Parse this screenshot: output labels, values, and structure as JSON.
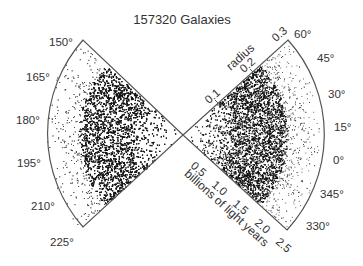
{
  "chart_data": {
    "type": "scatter",
    "subtype": "polar-wedge (galaxy redshift survey cone diagram)",
    "title": "157320 Galaxies",
    "point_count": 157320,
    "radial_axis": {
      "inner_label": "radius",
      "inner_ticks": [
        "0.1",
        "0.2",
        "0.3"
      ],
      "outer_label": "billions of light years",
      "outer_ticks": [
        "0.5",
        "1.0",
        "1.5",
        "2.0",
        "2.5"
      ],
      "range": [
        0,
        2.5
      ]
    },
    "angle_labels_right": [
      "60°",
      "45°",
      "30°",
      "15°",
      "0°",
      "345°",
      "330°"
    ],
    "angle_labels_left": [
      "150°",
      "165°",
      "180°",
      "195°",
      "210°",
      "225°"
    ],
    "wedges": [
      {
        "name": "right",
        "angle_from": -30,
        "angle_to": 60,
        "density_peak_radius": "≈1.0–1.5"
      },
      {
        "name": "left",
        "angle_from": 150,
        "angle_to": 225,
        "density_peak_radius": "≈1.0–1.5"
      }
    ],
    "xlabel": "",
    "ylabel": "",
    "grid": false,
    "legend": null,
    "colors": {
      "points": "#111111",
      "outline": "#555555",
      "text": "#333333"
    }
  },
  "title": "157320 Galaxies",
  "labels": {
    "radius": "radius",
    "bly": "billions of light years",
    "r01": "0.1",
    "r02": "0.2",
    "r03": "0.3",
    "b05": "0.5",
    "b10": "1.0",
    "b15": "1.5",
    "b20": "2.0",
    "b25": "2.5",
    "a60": "60°",
    "a45": "45°",
    "a30": "30°",
    "a15": "15°",
    "a0": "0°",
    "a345": "345°",
    "a330": "330°",
    "a150": "150°",
    "a165": "165°",
    "a180": "180°",
    "a195": "195°",
    "a210": "210°",
    "a225": "225°"
  }
}
